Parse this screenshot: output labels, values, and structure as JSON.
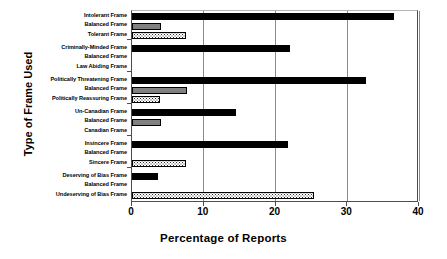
{
  "chart_data": {
    "type": "bar",
    "orientation": "horizontal",
    "title": "",
    "xlabel": "Percentage of Reports",
    "ylabel": "Type of Frame Used",
    "xlim": [
      0,
      40
    ],
    "xticks": [
      "0",
      "10",
      "20",
      "30",
      "40"
    ],
    "grid": "vertical",
    "legend": "none",
    "categories": [
      "Intolerant Frame",
      "Balanced Frame",
      "Tolerant Frame",
      "Criminally-Minded Frame",
      "Balanced Frame",
      "Law Abiding Frame",
      "Politically Threatening Frame",
      "Balanced Frame",
      "Politically Reassuring Frame",
      "Un-Canadian Frame",
      "Balanced Frame",
      "Canadian Frame",
      "Insincere Frame",
      "Balanced Frame",
      "Sincere Frame",
      "Deserving of Bias Frame",
      "Balanced Frame",
      "Undeserving of Bias Frame"
    ],
    "values": [
      36.5,
      4.0,
      7.5,
      22.0,
      0,
      0,
      32.6,
      7.7,
      3.9,
      14.5,
      4.0,
      0,
      21.7,
      0,
      7.5,
      3.6,
      0,
      25.4
    ],
    "fills": [
      "solid",
      "gray",
      "dotted",
      "solid",
      "gray",
      "dotted",
      "solid",
      "gray",
      "dotted",
      "solid",
      "gray",
      "dotted",
      "solid",
      "gray",
      "dotted",
      "solid",
      "gray",
      "dotted"
    ],
    "groups": [
      {
        "name": "Intolerance",
        "bars": [
          {
            "label": "Intolerant Frame",
            "value": 36.5,
            "fill": "solid"
          },
          {
            "label": "Balanced Frame",
            "value": 4.0,
            "fill": "gray"
          },
          {
            "label": "Tolerant Frame",
            "value": 7.5,
            "fill": "dotted"
          }
        ]
      },
      {
        "name": "Criminality",
        "bars": [
          {
            "label": "Criminally-Minded Frame",
            "value": 22.0,
            "fill": "solid"
          },
          {
            "label": "Balanced Frame",
            "value": 0,
            "fill": "gray"
          },
          {
            "label": "Law Abiding Frame",
            "value": 0,
            "fill": "dotted"
          }
        ]
      },
      {
        "name": "Political Threat",
        "bars": [
          {
            "label": "Politically Threatening Frame",
            "value": 32.6,
            "fill": "solid"
          },
          {
            "label": "Balanced Frame",
            "value": 7.7,
            "fill": "gray"
          },
          {
            "label": "Politically Reassuring Frame",
            "value": 3.9,
            "fill": "dotted"
          }
        ]
      },
      {
        "name": "Canadian-ness",
        "bars": [
          {
            "label": "Un-Canadian Frame",
            "value": 14.5,
            "fill": "solid"
          },
          {
            "label": "Balanced Frame",
            "value": 4.0,
            "fill": "gray"
          },
          {
            "label": "Canadian Frame",
            "value": 0,
            "fill": "dotted"
          }
        ]
      },
      {
        "name": "Sincerity",
        "bars": [
          {
            "label": "Insincere Frame",
            "value": 21.7,
            "fill": "solid"
          },
          {
            "label": "Balanced Frame",
            "value": 0,
            "fill": "gray"
          },
          {
            "label": "Sincere Frame",
            "value": 7.5,
            "fill": "dotted"
          }
        ]
      },
      {
        "name": "Bias Deservingness",
        "bars": [
          {
            "label": "Deserving of Bias Frame",
            "value": 3.6,
            "fill": "solid"
          },
          {
            "label": "Balanced Frame",
            "value": 0,
            "fill": "gray"
          },
          {
            "label": "Undeserving of Bias Frame",
            "value": 25.4,
            "fill": "dotted"
          }
        ]
      }
    ],
    "colors": {
      "solid": "#000000",
      "gray": "#808080",
      "dotted": "#ffffff",
      "axis": "#4d4d4d",
      "grid": "#8c8c8c",
      "background": "#ffffff"
    }
  }
}
